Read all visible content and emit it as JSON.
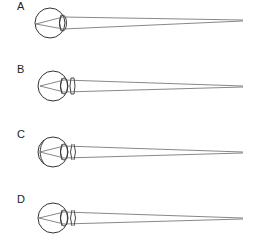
{
  "figure": {
    "stroke_color": "#333333",
    "ray_color": "#555555",
    "panels": [
      {
        "label": "A",
        "has_corrective_lens": false,
        "has_inner_retina_arc": false,
        "label_top": 1,
        "center_y": 23
      },
      {
        "label": "B",
        "has_corrective_lens": true,
        "has_inner_retina_arc": false,
        "label_top": 64,
        "center_y": 86
      },
      {
        "label": "C",
        "has_corrective_lens": true,
        "has_inner_retina_arc": true,
        "label_top": 129,
        "center_y": 152
      },
      {
        "label": "D",
        "has_corrective_lens": true,
        "has_inner_retina_arc": false,
        "label_top": 194,
        "center_y": 218
      }
    ]
  }
}
